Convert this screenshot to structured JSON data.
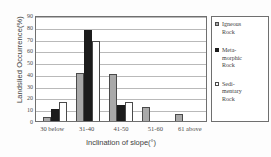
{
  "chart_data": {
    "type": "bar",
    "title": "",
    "xlabel": "Inclination of slope(°)",
    "ylabel": "Landslied Occurrence(%)",
    "categories": [
      "30 below",
      "31-40",
      "41-50",
      "51-60",
      "61 above"
    ],
    "series": [
      {
        "name": "Igneous Rock",
        "color": "#a9a9a9",
        "values": [
          3,
          41,
          40,
          11.5,
          6
        ]
      },
      {
        "name": "Meta-morphic Rock",
        "color": "#1c1c1c",
        "values": [
          10.5,
          77,
          14,
          0,
          0
        ]
      },
      {
        "name": "Sedi-mentary Rock",
        "color": "#ffffff",
        "values": [
          16.5,
          68,
          16.5,
          0,
          0
        ]
      }
    ],
    "ylim": [
      0,
      90
    ],
    "yticks": [
      0,
      10,
      20,
      30,
      40,
      50,
      60,
      70,
      80,
      90
    ],
    "ytick_labels": [
      "0",
      "10",
      "20",
      "30",
      "40",
      "50",
      "60",
      "70",
      "80",
      "90"
    ],
    "grid": true,
    "legend_position": "right",
    "legend_entries": [
      {
        "label_lines": [
          "Igneous",
          "Rock"
        ],
        "swatch": "igneous"
      },
      {
        "label_lines": [
          "Meta-",
          "morphic",
          "Rock"
        ],
        "swatch": "meta"
      },
      {
        "label_lines": [
          "Sedi-",
          "mentary",
          "Rock"
        ],
        "swatch": "sed"
      }
    ]
  },
  "axes": {
    "y_title": "Landslied Occurrence(%)",
    "x_title": "Inclination of slope(°)"
  }
}
